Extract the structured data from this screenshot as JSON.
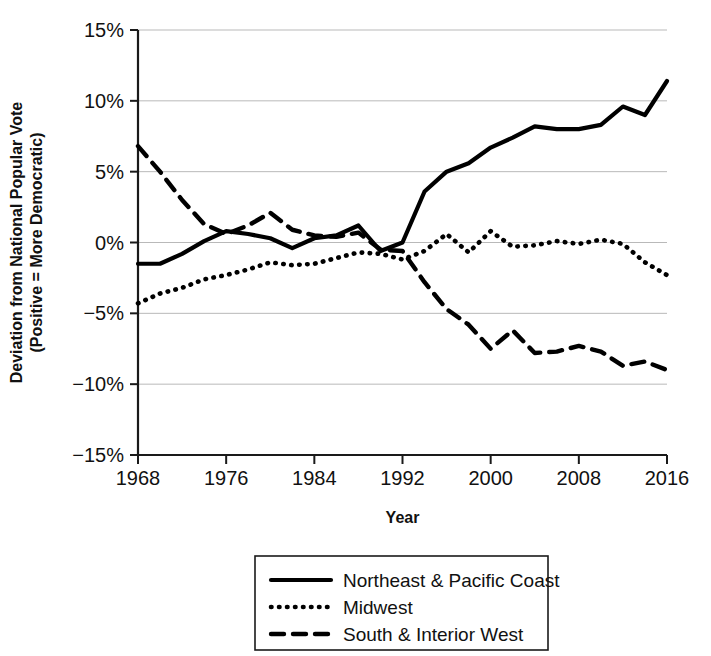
{
  "chart_data": {
    "type": "line",
    "title": "",
    "xlabel": "Year",
    "ylabel": "Deviation from National Popular Vote (Positive = More Democratic)",
    "ylabel_line1": "Deviation from National Popular Vote",
    "ylabel_line2": "(Positive = More Democratic)",
    "xlim": [
      1968,
      2016
    ],
    "ylim": [
      -15,
      15
    ],
    "grid": true,
    "legend_position": "bottom",
    "x_ticks": [
      1968,
      1976,
      1984,
      1992,
      2000,
      2008,
      2016
    ],
    "x_tick_labels": [
      "1968",
      "1976",
      "1984",
      "1992",
      "2000",
      "2008",
      "2016"
    ],
    "y_ticks": [
      15,
      10,
      5,
      0,
      -5,
      -10,
      -15
    ],
    "y_tick_labels": [
      "15%",
      "10%",
      "5%",
      "0%",
      "−5%",
      "−10%",
      "−15%"
    ],
    "x": [
      1968,
      1970,
      1972,
      1974,
      1976,
      1978,
      1980,
      1982,
      1984,
      1986,
      1988,
      1990,
      1992,
      1994,
      1996,
      1998,
      2000,
      2002,
      2004,
      2006,
      2008,
      2010,
      2012,
      2014,
      2016
    ],
    "series": [
      {
        "name": "Northeast & Pacific Coast",
        "style": "solid",
        "color": "#000000",
        "values": [
          -1.5,
          -1.5,
          -0.8,
          0.1,
          0.8,
          0.6,
          0.3,
          -0.4,
          0.3,
          0.5,
          1.2,
          -0.6,
          0.0,
          3.6,
          5.0,
          5.6,
          6.7,
          7.4,
          8.2,
          8.0,
          8.0,
          8.3,
          9.6,
          9.0,
          11.4
        ]
      },
      {
        "name": "Midwest",
        "style": "dotted",
        "color": "#000000",
        "values": [
          -4.3,
          -3.6,
          -3.2,
          -2.6,
          -2.3,
          -1.9,
          -1.4,
          -1.6,
          -1.5,
          -1.1,
          -0.7,
          -0.8,
          -1.2,
          -0.6,
          0.6,
          -0.7,
          0.8,
          -0.3,
          -0.2,
          0.1,
          -0.1,
          0.2,
          -0.1,
          -1.4,
          -2.3
        ]
      },
      {
        "name": "South & Interior West",
        "style": "dashed",
        "color": "#000000",
        "values": [
          6.8,
          5.0,
          3.0,
          1.3,
          0.6,
          1.2,
          2.1,
          0.9,
          0.5,
          0.4,
          0.7,
          -0.5,
          -0.6,
          -2.8,
          -4.7,
          -5.8,
          -7.5,
          -6.2,
          -7.8,
          -7.7,
          -7.3,
          -7.7,
          -8.7,
          -8.4,
          -9.0
        ]
      }
    ],
    "legend": [
      {
        "label": "Northeast & Pacific Coast",
        "style": "solid"
      },
      {
        "label": "Midwest",
        "style": "dotted"
      },
      {
        "label": "South & Interior West",
        "style": "dashed"
      }
    ]
  }
}
